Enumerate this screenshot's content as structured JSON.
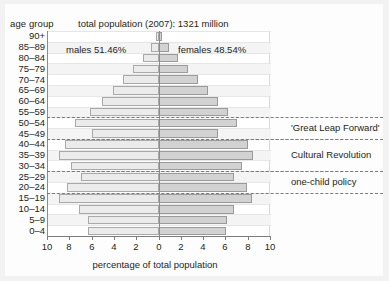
{
  "chart_data": {
    "type": "bar",
    "subtype": "population-pyramid",
    "title": "total population (2007): 1321 million",
    "xlabel": "percentage of total population",
    "ylabel": "age group",
    "xlim": [
      -10,
      10
    ],
    "xticks": [
      "10",
      "8",
      "6",
      "4",
      "2",
      "0",
      "2",
      "4",
      "6",
      "8",
      "10"
    ],
    "grid": true,
    "legend_position": "inside-top",
    "categories": [
      "90+",
      "85–89",
      "80–84",
      "75–79",
      "70–74",
      "65–69",
      "60–64",
      "55–59",
      "50–54",
      "45–49",
      "40–44",
      "35–39",
      "30–34",
      "25–29",
      "20–24",
      "15–19",
      "10–14",
      "5–9",
      "0–4"
    ],
    "series": [
      {
        "name": "males 51.46%",
        "side": "left",
        "color": "#ebebeb",
        "values": [
          0.25,
          0.7,
          1.4,
          2.3,
          3.2,
          4.1,
          5.1,
          6.2,
          7.6,
          6.0,
          8.5,
          9.0,
          7.9,
          7.0,
          8.3,
          9.0,
          7.2,
          6.4,
          6.4
        ]
      },
      {
        "name": "females 48.54%",
        "side": "right",
        "color": "#d2d2d2",
        "values": [
          0.3,
          0.9,
          1.7,
          2.6,
          3.5,
          4.4,
          5.3,
          6.2,
          7.0,
          5.3,
          8.0,
          8.5,
          7.5,
          6.8,
          7.9,
          8.4,
          6.8,
          6.1,
          6.0
        ]
      }
    ],
    "annotations": [
      {
        "label": "'Great Leap Forward'",
        "band_from": "50–54",
        "band_to": "45–49"
      },
      {
        "label": "Cultural Revolution",
        "band_from": "40–44",
        "band_to": "30–34"
      },
      {
        "label": "one-child policy",
        "band_from": "25–29",
        "band_to": "20–24"
      }
    ]
  },
  "labels": {
    "age_group": "age group",
    "males": "males 51.46%",
    "females": "females 48.54%"
  }
}
